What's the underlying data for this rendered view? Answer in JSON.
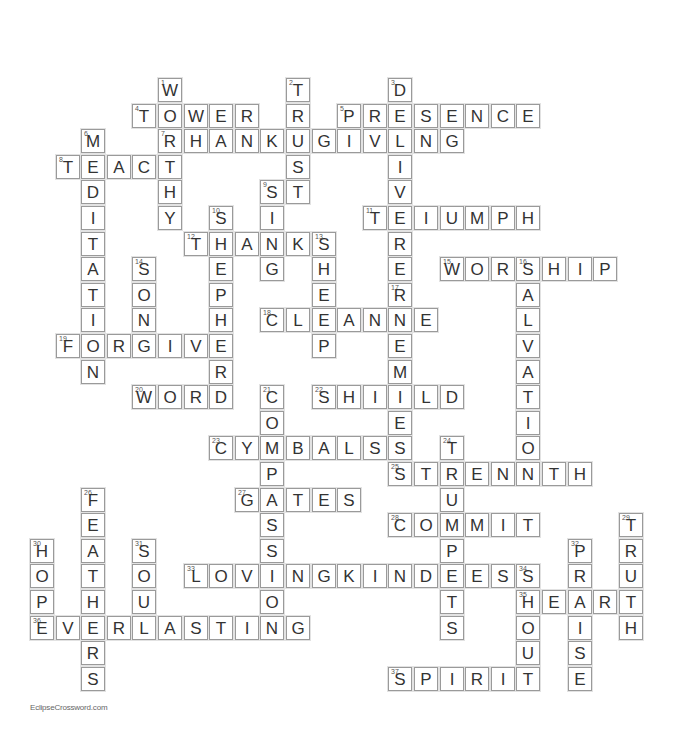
{
  "puzzle": {
    "grid": {
      "origin_x": 30,
      "origin_y": 78,
      "cell": 25.6
    },
    "entries": [
      {
        "num": 1,
        "dir": "down",
        "col": 5,
        "row": 0,
        "answer": "WORTHY"
      },
      {
        "num": 2,
        "dir": "down",
        "col": 10,
        "row": 0,
        "answer": "TRUST"
      },
      {
        "num": 3,
        "dir": "down",
        "col": 14,
        "row": 0,
        "answer": "DELIVERER"
      },
      {
        "num": 4,
        "dir": "across",
        "col": 4,
        "row": 1,
        "answer": "TOWER"
      },
      {
        "num": 5,
        "dir": "across",
        "col": 12,
        "row": 1,
        "answer": "PRESENCE"
      },
      {
        "num": 6,
        "dir": "down",
        "col": 2,
        "row": 2,
        "answer": "MEDITATION"
      },
      {
        "num": 7,
        "dir": "across",
        "col": 5,
        "row": 2,
        "answer": "THANKSGIVING"
      },
      {
        "num": 8,
        "dir": "across",
        "col": 1,
        "row": 3,
        "answer": "TEACH"
      },
      {
        "num": 9,
        "dir": "down",
        "col": 9,
        "row": 4,
        "answer": "SING"
      },
      {
        "num": 10,
        "dir": "down",
        "col": 7,
        "row": 5,
        "answer": "SHEPHERD"
      },
      {
        "num": 11,
        "dir": "across",
        "col": 13,
        "row": 5,
        "answer": "TRIUMPH"
      },
      {
        "num": 12,
        "dir": "across",
        "col": 6,
        "row": 6,
        "answer": "THANKS"
      },
      {
        "num": 13,
        "dir": "down",
        "col": 11,
        "row": 6,
        "answer": "SHEEP"
      },
      {
        "num": 14,
        "dir": "down",
        "col": 4,
        "row": 7,
        "answer": "SONG"
      },
      {
        "num": 15,
        "dir": "across",
        "col": 16,
        "row": 7,
        "answer": "WORSHIP"
      },
      {
        "num": 16,
        "dir": "down",
        "col": 19,
        "row": 7,
        "answer": "SALVATION"
      },
      {
        "num": 17,
        "dir": "down",
        "col": 14,
        "row": 8,
        "answer": "ENEMIES"
      },
      {
        "num": 18,
        "dir": "across",
        "col": 9,
        "row": 9,
        "answer": "CLEANSE"
      },
      {
        "num": 19,
        "dir": "across",
        "col": 1,
        "row": 10,
        "answer": "FORGIVE"
      },
      {
        "num": 20,
        "dir": "across",
        "col": 4,
        "row": 12,
        "answer": "WORD"
      },
      {
        "num": 21,
        "dir": "down",
        "col": 9,
        "row": 12,
        "answer": "COMPASSION"
      },
      {
        "num": 22,
        "dir": "across",
        "col": 11,
        "row": 12,
        "answer": "SHIELD"
      },
      {
        "num": 23,
        "dir": "across",
        "col": 7,
        "row": 14,
        "answer": "CYMBALS"
      },
      {
        "num": 24,
        "dir": "down",
        "col": 16,
        "row": 14,
        "answer": "TRUMPETS"
      },
      {
        "num": 25,
        "dir": "across",
        "col": 14,
        "row": 15,
        "answer": "STRENGTH"
      },
      {
        "num": 26,
        "dir": "down",
        "col": 2,
        "row": 16,
        "answer": "FEATHERS"
      },
      {
        "num": 27,
        "dir": "across",
        "col": 8,
        "row": 16,
        "answer": "GATES"
      },
      {
        "num": 28,
        "dir": "across",
        "col": 14,
        "row": 17,
        "answer": "COMMIT"
      },
      {
        "num": 29,
        "dir": "down",
        "col": 23,
        "row": 17,
        "answer": "TRUTH"
      },
      {
        "num": 30,
        "dir": "down",
        "col": 0,
        "row": 18,
        "answer": "HOPE"
      },
      {
        "num": 31,
        "dir": "down",
        "col": 4,
        "row": 18,
        "answer": "SOUL"
      },
      {
        "num": 32,
        "dir": "down",
        "col": 21,
        "row": 18,
        "answer": "PRAISE"
      },
      {
        "num": 33,
        "dir": "across",
        "col": 6,
        "row": 19,
        "answer": "LOVINGKINDNESS"
      },
      {
        "num": 34,
        "dir": "down",
        "col": 19,
        "row": 19,
        "answer": "SHOUT"
      },
      {
        "num": 35,
        "dir": "across",
        "col": 19,
        "row": 20,
        "answer": "HEART"
      },
      {
        "num": 36,
        "dir": "across",
        "col": 0,
        "row": 21,
        "answer": "EVERLASTING"
      },
      {
        "num": 37,
        "dir": "across",
        "col": 14,
        "row": 23,
        "answer": "SPIRIT"
      }
    ]
  },
  "footer": {
    "credit": "EclipseCrossword.com"
  }
}
